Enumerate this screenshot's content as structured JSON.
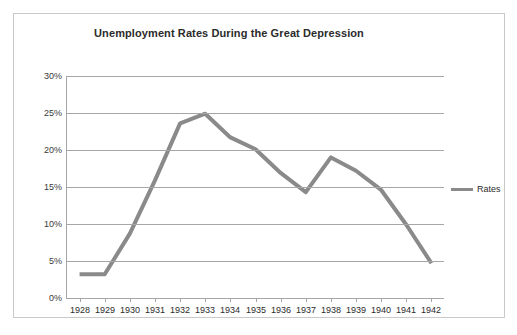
{
  "chart_data": {
    "type": "line",
    "title": "Unemployment Rates During the Great Depression",
    "xlabel": "",
    "ylabel": "",
    "categories": [
      "1928",
      "1929",
      "1930",
      "1931",
      "1932",
      "1933",
      "1934",
      "1935",
      "1936",
      "1937",
      "1938",
      "1939",
      "1940",
      "1941",
      "1942"
    ],
    "series": [
      {
        "name": "Rates",
        "color": "#8a8a8a",
        "values": [
          3.2,
          3.2,
          8.7,
          15.9,
          23.6,
          24.9,
          21.7,
          20.1,
          16.9,
          14.3,
          19.0,
          17.2,
          14.6,
          9.9,
          4.7
        ]
      }
    ],
    "ylim": [
      0,
      30
    ],
    "ytick_values": [
      0,
      5,
      10,
      15,
      20,
      25,
      30
    ],
    "ytick_labels": [
      "0%",
      "5%",
      "10%",
      "15%",
      "20%",
      "25%",
      "30%"
    ],
    "grid": true,
    "legend_position": "right",
    "legend_entries": [
      "Rates"
    ]
  },
  "legend": {
    "rates_label": "Rates",
    "swatch_name": "line-swatch"
  }
}
